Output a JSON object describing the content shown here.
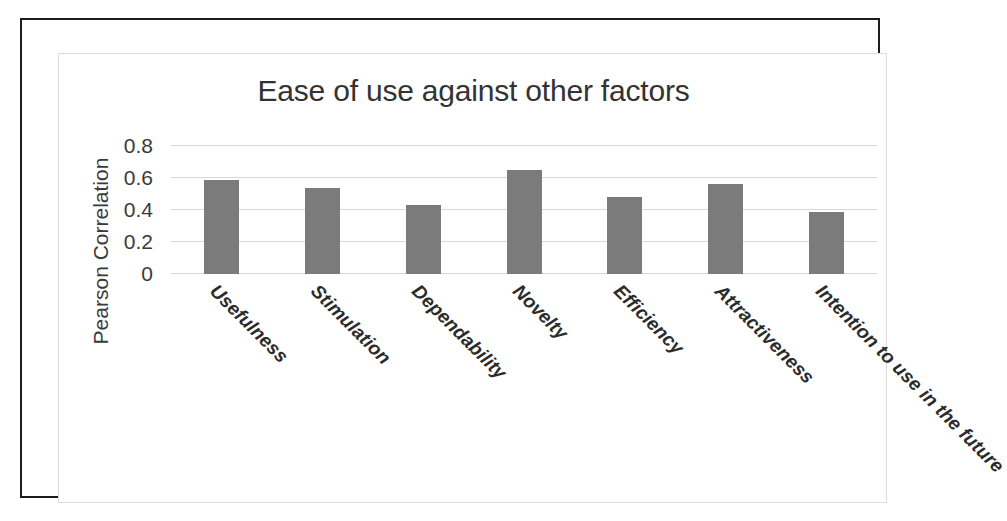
{
  "chart_data": {
    "type": "bar",
    "title": "Ease of use against other factors",
    "xlabel": "",
    "ylabel": "Pearson Correlation",
    "ylim": [
      0,
      0.8
    ],
    "ytick_labels": [
      "0",
      "0.2",
      "0.4",
      "0.6",
      "0.8"
    ],
    "ytick_values": [
      0,
      0.2,
      0.4,
      0.6,
      0.8
    ],
    "grid": true,
    "legend": "none",
    "bar_color": "#7b7b7b",
    "categories": [
      "Usefulness",
      "Stimulation",
      "Dependability",
      "Novelty",
      "Efficiency",
      "Attractiveness",
      "Intention to use in the future"
    ],
    "values": [
      0.59,
      0.54,
      0.43,
      0.65,
      0.48,
      0.56,
      0.39
    ]
  }
}
